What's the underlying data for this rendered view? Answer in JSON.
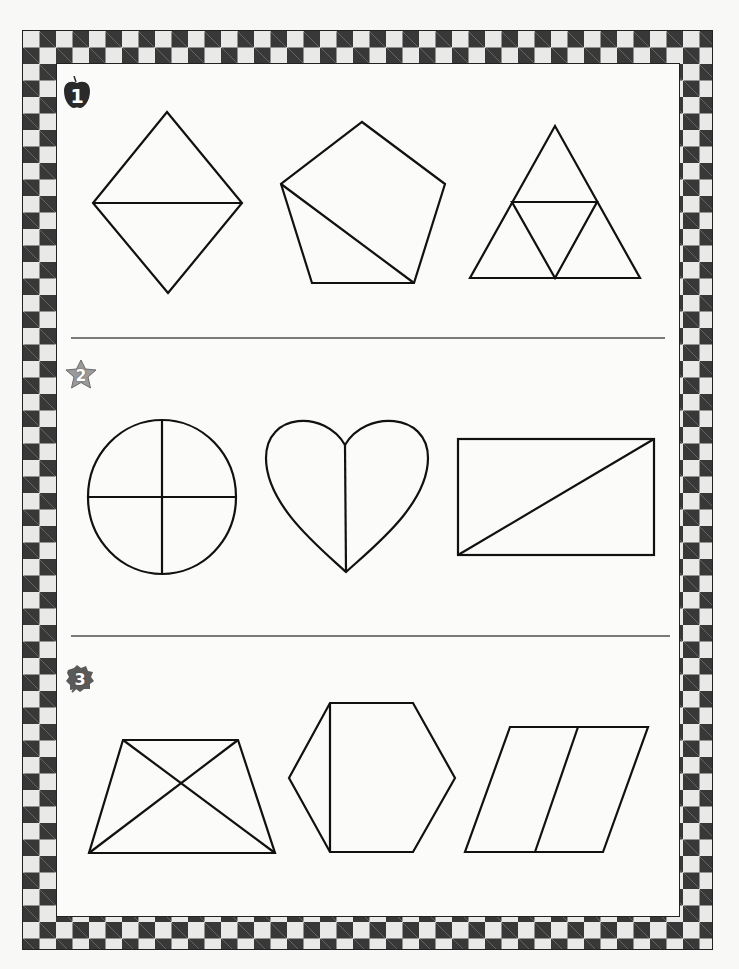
{
  "worksheet": {
    "title": "",
    "border": {
      "style": "checkerboard",
      "dark_color": "#383838",
      "light_color": "#e9e9e7"
    },
    "sections": [
      {
        "number": "1",
        "badge_icon": "apple-icon",
        "shapes": [
          {
            "name": "rhombus",
            "parts": 2,
            "divider": "horizontal diagonal"
          },
          {
            "name": "pentagon",
            "parts": 2,
            "divider": "diagonal"
          },
          {
            "name": "triangle",
            "parts": 4,
            "divider": "midpoint triangle"
          }
        ]
      },
      {
        "number": "2",
        "badge_icon": "star-icon",
        "shapes": [
          {
            "name": "circle",
            "parts": 4,
            "divider": "cross"
          },
          {
            "name": "heart",
            "parts": 2,
            "divider": "vertical"
          },
          {
            "name": "rectangle",
            "parts": 2,
            "divider": "diagonal"
          }
        ]
      },
      {
        "number": "3",
        "badge_icon": "leaf-icon",
        "shapes": [
          {
            "name": "trapezoid",
            "parts": 4,
            "divider": "both diagonals"
          },
          {
            "name": "hexagon",
            "parts": 2,
            "divider": "vertical"
          },
          {
            "name": "parallelogram",
            "parts": 2,
            "divider": "slanted"
          }
        ]
      }
    ],
    "colors": {
      "line": "#111111",
      "divider": "#555555",
      "apple": "#2a2a2a",
      "star": "#8a8a8a",
      "leaf": "#5a5a5a"
    }
  }
}
